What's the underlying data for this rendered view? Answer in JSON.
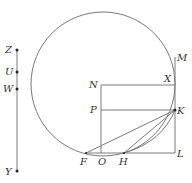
{
  "diagram": {
    "type": "geometric-construction",
    "colors": {
      "stroke": "#7a7a7a",
      "label": "#333333",
      "background": "#ffffff"
    },
    "circle": {
      "cx": 103,
      "cy": 84,
      "r": 72
    },
    "points": {
      "Z": {
        "label": "Z",
        "x": 17,
        "y": 50
      },
      "U": {
        "label": "U",
        "x": 17,
        "y": 72
      },
      "W": {
        "label": "W",
        "x": 17,
        "y": 89
      },
      "Y": {
        "label": "Y",
        "x": 17,
        "y": 171
      },
      "M": {
        "label": "M",
        "x": 175,
        "y": 57
      },
      "N": {
        "label": "N",
        "x": 101,
        "y": 85
      },
      "X": {
        "label": "X",
        "x": 175,
        "y": 85
      },
      "P": {
        "label": "P",
        "x": 101,
        "y": 110
      },
      "K": {
        "label": "K",
        "x": 175,
        "y": 110
      },
      "F": {
        "label": "F",
        "x": 86,
        "y": 153
      },
      "O": {
        "label": "O",
        "x": 101,
        "y": 153
      },
      "H": {
        "label": "H",
        "x": 124,
        "y": 153
      },
      "L": {
        "label": "L",
        "x": 175,
        "y": 153
      }
    },
    "segments": [
      [
        "Z",
        "Y"
      ],
      [
        "N",
        "X"
      ],
      [
        "P",
        "K"
      ],
      [
        "N",
        "O"
      ],
      [
        "M",
        "L"
      ],
      [
        "F",
        "L"
      ],
      [
        "F",
        "K"
      ],
      [
        "H",
        "K"
      ]
    ],
    "arcs": [
      {
        "from": "H",
        "to": "K"
      }
    ]
  }
}
